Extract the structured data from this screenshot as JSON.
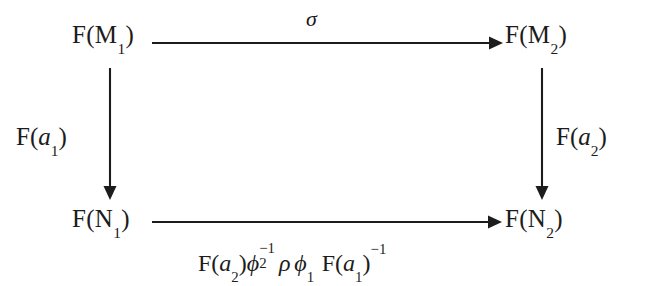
{
  "diagram": {
    "type": "commutative-square",
    "nodes": {
      "top_left": {
        "functor": "F",
        "object": "M",
        "index": "1"
      },
      "top_right": {
        "functor": "F",
        "object": "M",
        "index": "2"
      },
      "bottom_left": {
        "functor": "F",
        "object": "N",
        "index": "1"
      },
      "bottom_right": {
        "functor": "F",
        "object": "N",
        "index": "2"
      }
    },
    "edges": {
      "top": {
        "label": "σ",
        "from": "F(M_1)",
        "to": "F(M_2)",
        "direction": "right"
      },
      "left": {
        "functor": "F",
        "arg": "a",
        "index": "1",
        "from": "F(M_1)",
        "to": "F(N_1)",
        "direction": "down"
      },
      "right": {
        "functor": "F",
        "arg": "a",
        "index": "2",
        "from": "F(M_2)",
        "to": "F(N_2)",
        "direction": "down"
      },
      "bottom": {
        "from": "F(N_1)",
        "to": "F(N_2)",
        "direction": "right",
        "terms": {
          "t1_functor": "F",
          "t1_arg": "a",
          "t1_index": "2",
          "t2_symbol": "ϕ",
          "t2_sub": "2",
          "t2_sup": "−1",
          "t3_symbol": "ρ",
          "t4_symbol": "ϕ",
          "t4_sub": "1",
          "t5_functor": "F",
          "t5_arg": "a",
          "t5_index": "1",
          "t5_sup": "−1"
        }
      }
    },
    "style": {
      "ink_color": "#1c1c1c",
      "background_color": "#ffffff"
    }
  }
}
